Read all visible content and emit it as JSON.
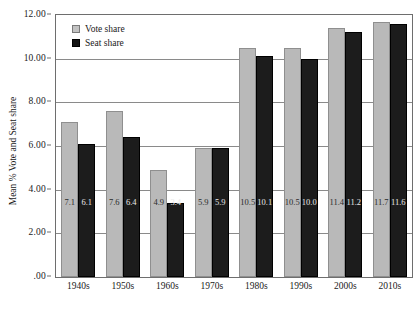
{
  "chart_data": {
    "type": "bar",
    "title": "",
    "xlabel": "",
    "ylabel": "Mean % Vote and Seat share",
    "ylim": [
      0,
      12
    ],
    "ytick_labels": [
      "12.00",
      "10.00",
      "8.00",
      "6.00",
      "4.00",
      "2.00",
      ".00"
    ],
    "ytick_values": [
      12,
      10,
      8,
      6,
      4,
      2,
      0
    ],
    "grid": true,
    "legend_position": "top-left",
    "categories": [
      "1940s",
      "1950s",
      "1960s",
      "1970s",
      "1980s",
      "1990s",
      "2000s",
      "2010s"
    ],
    "series": [
      {
        "name": "Vote share",
        "color": "#b9b9b9",
        "values": [
          7.1,
          7.6,
          4.9,
          5.9,
          10.5,
          10.5,
          11.4,
          11.7
        ],
        "labels": [
          "7.1",
          "7.6",
          "4.9",
          "5.9",
          "10.5",
          "10.5",
          "11.4",
          "11.7"
        ]
      },
      {
        "name": "Seat share",
        "color": "#1c1c1c",
        "values": [
          6.1,
          6.4,
          3.4,
          5.9,
          10.1,
          10.0,
          11.2,
          11.6
        ],
        "labels": [
          "6.1",
          "6.4",
          "3.4",
          "5.9",
          "10.1",
          "10.0",
          "11.2",
          "11.6"
        ]
      }
    ]
  },
  "legend": {
    "items": [
      {
        "label": "Vote share",
        "swatch": "light-gray-swatch"
      },
      {
        "label": "Seat share",
        "swatch": "black-swatch"
      }
    ]
  },
  "colors": {
    "vote_share": "#b9b9b9",
    "seat_share": "#1c1c1c",
    "gridline": "#8a8a8a",
    "frame": "#6e6e6e",
    "background": "#ffffff",
    "text": "#1a1a1a"
  }
}
